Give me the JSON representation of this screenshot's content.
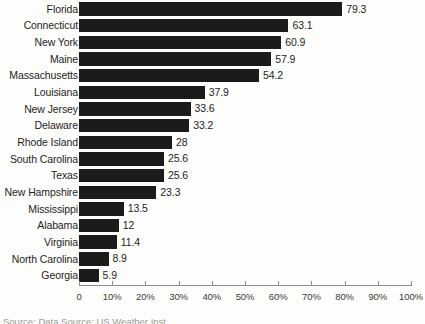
{
  "chart_data": {
    "type": "bar",
    "orientation": "horizontal",
    "title": "",
    "xlabel": "",
    "ylabel": "",
    "xlim": [
      0,
      100
    ],
    "grid": false,
    "legend": null,
    "bar_color": "#1b1b1b",
    "background_color": "#fdfdfc",
    "axis_color": "#8d8d8d",
    "value_label_format": "plain-number",
    "categories": [
      "Florida",
      "Connecticut",
      "New York",
      "Maine",
      "Massachusetts",
      "Louisiana",
      "New Jersey",
      "Delaware",
      "Rhode Island",
      "South Carolina",
      "Texas",
      "New Hampshire",
      "Mississippi",
      "Alabama",
      "Virginia",
      "North Carolina",
      "Georgia"
    ],
    "values": [
      79.3,
      63.1,
      60.9,
      57.9,
      54.2,
      37.9,
      33.6,
      33.2,
      28,
      25.6,
      25.6,
      23.3,
      13.5,
      12,
      11.4,
      8.9,
      5.9
    ],
    "value_labels": [
      "79.3",
      "63.1",
      "60.9",
      "57.9",
      "54.2",
      "37.9",
      "33.6",
      "33.2",
      "28",
      "25.6",
      "25.6",
      "23.3",
      "13.5",
      "12",
      "11.4",
      "8.9",
      "5.9"
    ],
    "xticks": [
      0,
      10,
      20,
      30,
      40,
      50,
      60,
      70,
      80,
      90,
      100
    ],
    "xtick_labels": [
      "0",
      "10%",
      "20%",
      "30%",
      "40%",
      "50%",
      "60%",
      "70%",
      "80%",
      "90%",
      "100%"
    ]
  },
  "source_note": "Source: Data Source: US Weather Inst."
}
